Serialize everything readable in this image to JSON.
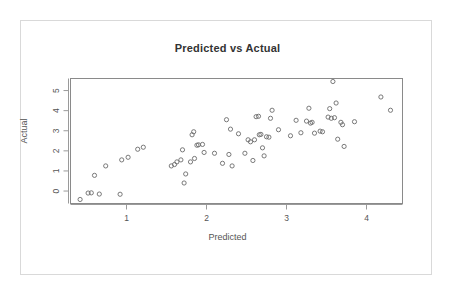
{
  "chart_data": {
    "type": "scatter",
    "title": "Predicted vs Actual",
    "xlabel": "Predicted",
    "ylabel": "Actual",
    "xlim": [
      0.3,
      4.45
    ],
    "ylim": [
      -0.62,
      5.6
    ],
    "xticks": [
      1,
      2,
      3,
      4
    ],
    "yticks": [
      0,
      1,
      2,
      3,
      4,
      5
    ],
    "grid": false,
    "legend": null,
    "marker": "open-circle",
    "marker_color": "#6b6b6b",
    "points": [
      [
        0.42,
        -0.42
      ],
      [
        0.52,
        -0.1
      ],
      [
        0.56,
        -0.09
      ],
      [
        0.6,
        0.78
      ],
      [
        0.66,
        -0.15
      ],
      [
        0.74,
        1.25
      ],
      [
        0.92,
        -0.16
      ],
      [
        0.94,
        1.55
      ],
      [
        1.02,
        1.68
      ],
      [
        1.14,
        2.08
      ],
      [
        1.21,
        2.18
      ],
      [
        1.56,
        1.25
      ],
      [
        1.6,
        1.32
      ],
      [
        1.63,
        1.45
      ],
      [
        1.68,
        1.55
      ],
      [
        1.7,
        2.05
      ],
      [
        1.72,
        0.4
      ],
      [
        1.74,
        0.85
      ],
      [
        1.8,
        1.45
      ],
      [
        1.82,
        2.8
      ],
      [
        1.84,
        2.95
      ],
      [
        1.85,
        1.62
      ],
      [
        1.88,
        2.28
      ],
      [
        1.9,
        2.3
      ],
      [
        1.95,
        2.32
      ],
      [
        1.97,
        1.92
      ],
      [
        2.1,
        1.88
      ],
      [
        2.2,
        1.38
      ],
      [
        2.25,
        3.55
      ],
      [
        2.28,
        1.82
      ],
      [
        2.3,
        3.08
      ],
      [
        2.32,
        1.25
      ],
      [
        2.4,
        2.85
      ],
      [
        2.48,
        1.88
      ],
      [
        2.52,
        2.55
      ],
      [
        2.55,
        2.45
      ],
      [
        2.58,
        1.52
      ],
      [
        2.6,
        2.55
      ],
      [
        2.62,
        3.7
      ],
      [
        2.65,
        3.72
      ],
      [
        2.66,
        2.8
      ],
      [
        2.68,
        2.82
      ],
      [
        2.7,
        2.15
      ],
      [
        2.72,
        1.75
      ],
      [
        2.75,
        2.7
      ],
      [
        2.78,
        2.68
      ],
      [
        2.8,
        3.62
      ],
      [
        2.82,
        4.02
      ],
      [
        2.9,
        3.05
      ],
      [
        3.05,
        2.75
      ],
      [
        3.12,
        3.52
      ],
      [
        3.18,
        2.9
      ],
      [
        3.25,
        3.48
      ],
      [
        3.28,
        4.12
      ],
      [
        3.3,
        3.38
      ],
      [
        3.32,
        3.42
      ],
      [
        3.35,
        2.88
      ],
      [
        3.42,
        2.98
      ],
      [
        3.45,
        2.95
      ],
      [
        3.52,
        3.68
      ],
      [
        3.54,
        4.1
      ],
      [
        3.56,
        3.62
      ],
      [
        3.58,
        5.45
      ],
      [
        3.6,
        3.65
      ],
      [
        3.62,
        4.38
      ],
      [
        3.64,
        2.58
      ],
      [
        3.68,
        3.42
      ],
      [
        3.7,
        3.3
      ],
      [
        3.72,
        2.22
      ],
      [
        3.85,
        3.45
      ],
      [
        4.18,
        4.68
      ],
      [
        4.3,
        4.02
      ]
    ]
  }
}
